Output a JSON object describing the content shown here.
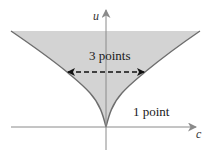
{
  "diagram": {
    "axes": {
      "x_label": "c",
      "y_label": "u"
    },
    "regions": [
      {
        "id": "inside-cusp",
        "label": "3 points",
        "fill": "#d3d3d3"
      },
      {
        "id": "outside-cusp",
        "label": "1 point",
        "fill": "#ffffff"
      }
    ],
    "boundary": {
      "shape": "cusp curve",
      "color": "#6e6e6e"
    },
    "arrow": {
      "style": "dashed double-headed",
      "color": "#111111"
    },
    "colors": {
      "axis": "#8a8a8a",
      "shading": "#d3d3d3",
      "boundary": "#6e6e6e",
      "text": "#1a1a1a"
    }
  }
}
